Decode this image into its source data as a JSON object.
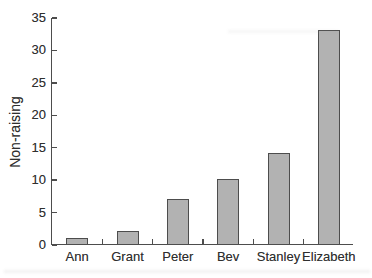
{
  "chart_data": {
    "type": "bar",
    "categories": [
      "Ann",
      "Grant",
      "Peter",
      "Bev",
      "Stanley",
      "Elizabeth"
    ],
    "values": [
      1,
      2,
      7,
      10,
      14,
      33
    ],
    "title": "",
    "xlabel": "",
    "ylabel": "Non-raising",
    "ylim": [
      0,
      35
    ],
    "yticks": [
      0,
      5,
      10,
      15,
      20,
      25,
      30,
      35
    ],
    "grid": false,
    "legend": false,
    "bar_fill_color": "#b2b2b2",
    "bar_border_color": "#4d4d4d",
    "axis_color": "#4d4d4d",
    "text_color": "#2f2f2f",
    "background_color": "#ffffff"
  }
}
